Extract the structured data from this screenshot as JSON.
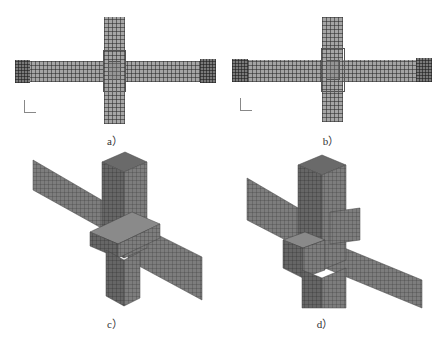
{
  "figure": {
    "panels": [
      {
        "id": "a",
        "label": "a）",
        "view": "plan",
        "description": "top view of cross-shaped beam-column joint mesh"
      },
      {
        "id": "b",
        "label": "b）",
        "view": "plan",
        "description": "top view of cross-shaped beam-column joint mesh (variant)"
      },
      {
        "id": "c",
        "label": "c）",
        "view": "isometric",
        "description": "3D view of beam-column joint mesh"
      },
      {
        "id": "d",
        "label": "d）",
        "view": "isometric",
        "description": "3D view of beam-column joint mesh (variant)"
      }
    ],
    "axis_triad": {
      "x_label": "x",
      "y_label": "y"
    },
    "colors": {
      "mesh_fill": "#8f8f8f",
      "mesh_line": "#3a3a3a",
      "background": "#ffffff"
    }
  }
}
